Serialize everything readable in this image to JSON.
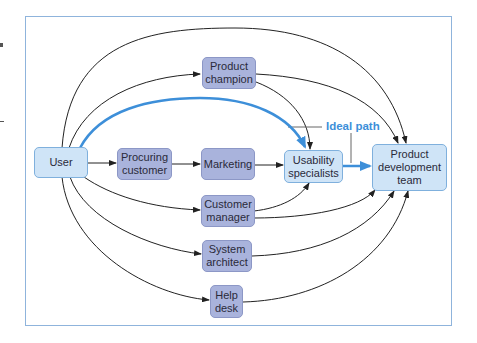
{
  "diagram": {
    "title": "",
    "nodes": {
      "user": "User",
      "procuring_customer": "Procuring customer",
      "marketing": "Marketing",
      "usability_specialists": "Usability specialists",
      "product_development_team": "Product development team",
      "product_champion": "Product champion",
      "customer_manager": "Customer manager",
      "system_architect": "System architect",
      "help_desk": "Help desk"
    },
    "labels": {
      "ideal_path": "Ideal path"
    },
    "edges": [
      {
        "from": "User",
        "to": "Procuring customer"
      },
      {
        "from": "Procuring customer",
        "to": "Marketing"
      },
      {
        "from": "Marketing",
        "to": "Usability specialists"
      },
      {
        "from": "Usability specialists",
        "to": "Product development team",
        "style": "ideal"
      },
      {
        "from": "User",
        "to": "Usability specialists",
        "style": "ideal"
      },
      {
        "from": "User",
        "to": "Product champion"
      },
      {
        "from": "User",
        "to": "Product development team"
      },
      {
        "from": "Product champion",
        "to": "Usability specialists"
      },
      {
        "from": "Product champion",
        "to": "Product development team"
      },
      {
        "from": "User",
        "to": "Customer manager"
      },
      {
        "from": "Customer manager",
        "to": "Usability specialists"
      },
      {
        "from": "Customer manager",
        "to": "Product development team"
      },
      {
        "from": "User",
        "to": "System architect"
      },
      {
        "from": "System architect",
        "to": "Product development team"
      },
      {
        "from": "User",
        "to": "Help desk"
      },
      {
        "from": "Help desk",
        "to": "Product development team"
      }
    ],
    "colors": {
      "ideal_path": "#3d8fd9",
      "frame_border": "#8fb4dc",
      "node_dark": "#a9b3dc",
      "node_light": "#cfe4f7"
    }
  }
}
